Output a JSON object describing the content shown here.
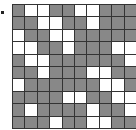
{
  "colors": {
    "filled": "#888888",
    "empty": "#ffffff",
    "line": "#333333"
  },
  "grid": {
    "rows": 10,
    "cols": 10,
    "cells": [
      "GWWGGWWGGG",
      "GGWWGGWGGG",
      "WGGWWGGGGG",
      "WWGGWGGGWW",
      "GWWGGGGGGW",
      "GGWGGGWWGG",
      "WGGGGGGWWG",
      "GGGGWWGGWW",
      "GWGGGGWGGW",
      "GGGWGGWWGG"
    ]
  }
}
